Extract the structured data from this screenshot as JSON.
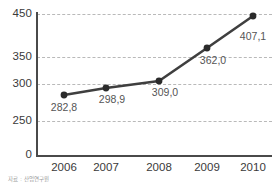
{
  "chart_data": {
    "type": "line",
    "title": "",
    "subtitle": "",
    "xlabel": "",
    "ylabel": "",
    "grid": true,
    "legend": null,
    "categories": [
      "2006",
      "2007",
      "2008",
      "2009",
      "2010"
    ],
    "values": [
      282.8,
      298.9,
      309.0,
      362.0,
      407.1
    ],
    "value_labels": [
      "282,8",
      "298,9",
      "309,0",
      "362,0",
      "407,1"
    ],
    "series": [
      {
        "name": "",
        "values": [
          282.8,
          298.9,
          309.0,
          362.0,
          407.1
        ],
        "color": "#3f3f3f",
        "marker": "circle"
      }
    ],
    "y_ticks": [
      450,
      350,
      300,
      250,
      0
    ],
    "y_tick_labels": [
      "450",
      "350",
      "300",
      "250",
      "0"
    ],
    "ylim": [
      0,
      450
    ],
    "axis_note": "non-linear y axis: 0, 250, 300, 350, 450",
    "decimal_separator": ","
  },
  "axes": {
    "y_ticks": [
      {
        "label": "450",
        "y": 14
      },
      {
        "label": "350",
        "y": 57
      },
      {
        "label": "300",
        "y": 84
      },
      {
        "label": "250",
        "y": 121
      },
      {
        "label": "0",
        "y": 155
      }
    ],
    "gridlines_y": [
      14,
      57,
      84,
      121
    ],
    "x_ticks": [
      {
        "label": "2006",
        "x": 64
      },
      {
        "label": "2007",
        "x": 106
      },
      {
        "label": "2008",
        "x": 159
      },
      {
        "label": "2009",
        "x": 207
      },
      {
        "label": "2010",
        "x": 253
      }
    ]
  },
  "points": [
    {
      "label": "282,8",
      "x": 64,
      "y": 95,
      "label_x": 64,
      "label_y": 102
    },
    {
      "label": "298,9",
      "x": 106,
      "y": 88,
      "label_x": 112,
      "label_y": 94
    },
    {
      "label": "309,0",
      "x": 159,
      "y": 81,
      "label_x": 165,
      "label_y": 87
    },
    {
      "label": "362,0",
      "x": 207,
      "y": 48,
      "label_x": 213,
      "label_y": 55
    },
    {
      "label": "407,1",
      "x": 253,
      "y": 16,
      "label_x": 253,
      "label_y": 31
    }
  ],
  "footnote": {
    "text": "자료 : 산업연구원"
  },
  "colors": {
    "line": "#3f3f3f",
    "marker": "#2b2b2b",
    "grid": "#b9b9b9",
    "axis": "#4a4a4a",
    "tick_text": "#3a3a3a",
    "label_text": "#555555",
    "footnote_text": "#9a9a9a",
    "background": "#ffffff"
  }
}
